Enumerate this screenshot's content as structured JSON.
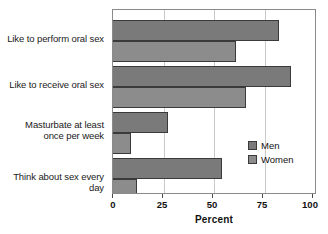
{
  "chart_data": {
    "type": "bar",
    "orientation": "horizontal",
    "title": "",
    "xlabel": "Percent",
    "ylabel": "",
    "xlim": [
      0,
      100
    ],
    "xticks": [
      0,
      25,
      50,
      75,
      100
    ],
    "xtick_labels": [
      "0",
      "25",
      "50",
      "75",
      "100"
    ],
    "grid": true,
    "grid_axis": "x",
    "legend_position": "center-right",
    "categories": [
      "Like to perform oral sex",
      "Like to receive oral sex",
      "Masturbate at least once per week",
      "Think about sex every day"
    ],
    "category_lines": [
      [
        "Like to perform oral sex"
      ],
      [
        "Like to receive oral sex"
      ],
      [
        "Masturbate at least",
        "once per week"
      ],
      [
        "Think about sex every day"
      ]
    ],
    "series": [
      {
        "name": "Men",
        "color": "#7a7a7a",
        "values": [
          82,
          88,
          27,
          54
        ]
      },
      {
        "name": "Women",
        "color": "#8c8c8c",
        "values": [
          61,
          66,
          9,
          12
        ]
      }
    ]
  },
  "legend": {
    "entries": [
      {
        "label": "Men"
      },
      {
        "label": "Women"
      }
    ]
  },
  "axis": {
    "title": "Percent"
  }
}
